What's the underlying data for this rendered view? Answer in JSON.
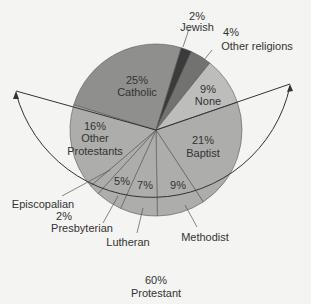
{
  "chart_data": {
    "type": "pie",
    "title": "",
    "start_angle_deg_svg": -18.9,
    "direction": "clockwise",
    "slices": [
      {
        "label": "Baptist",
        "value": 21,
        "pct": "21%",
        "group": "Protestant",
        "color": "#adadab"
      },
      {
        "label": "Methodist",
        "value": 9,
        "pct": "9%",
        "group": "Protestant",
        "color": "#adadab"
      },
      {
        "label": "Lutheran",
        "value": 7,
        "pct": "7%",
        "group": "Protestant",
        "color": "#adadab"
      },
      {
        "label": "Presbyterian",
        "value": 5,
        "pct": "5%",
        "group": "Protestant",
        "color": "#adadab"
      },
      {
        "label": "Episcopalian",
        "value": 2,
        "pct": "2%",
        "group": "Protestant",
        "color": "#adadab"
      },
      {
        "label": "Other Protestants",
        "value": 16,
        "pct": "16%",
        "group": "Protestant",
        "color": "#adadab"
      },
      {
        "label": "Catholic",
        "value": 25,
        "pct": "25%",
        "group": "",
        "color": "#8f8f8d"
      },
      {
        "label": "Jewish",
        "value": 2,
        "pct": "2%",
        "group": "",
        "color": "#3b3b3b"
      },
      {
        "label": "Other religions",
        "value": 4,
        "pct": "4%",
        "group": "",
        "color": "#727270"
      },
      {
        "label": "None",
        "value": 9,
        "pct": "9%",
        "group": "",
        "color": "#bdbdbb"
      }
    ],
    "group_annotation": {
      "label": "Protestant",
      "pct": "60%",
      "value": 60
    }
  },
  "labels": {
    "jewish_pct": "2%",
    "jewish": "Jewish",
    "other_rel_pct": "4%",
    "other_rel": "Other religions",
    "catholic_pct": "25%",
    "catholic": "Catholic",
    "none_pct": "9%",
    "none": "None",
    "baptist_pct": "21%",
    "baptist": "Baptist",
    "otherprot_pct": "16%",
    "otherprot_1": "Other",
    "otherprot_2": "Protestants",
    "presby_pct": "5%",
    "lutheran_pct": "7%",
    "methodist_pct": "9%",
    "episcopalian": "Episcopalian",
    "episcopalian_pct": "2%",
    "presbyterian": "Presbyterian",
    "lutheran": "Lutheran",
    "methodist": "Methodist",
    "protestant_pct": "60%",
    "protestant": "Protestant"
  }
}
